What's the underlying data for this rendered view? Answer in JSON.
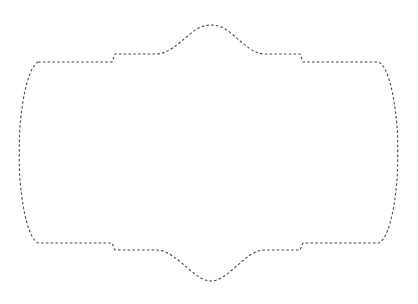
{
  "canvas": {
    "width": 418,
    "height": 304,
    "background_color": "#ffffff",
    "description": "dashed-ornamental-frame-outline"
  },
  "shape": {
    "name": "ornamental-label-frame",
    "stroke_color": "#4a4a52",
    "stroke_width": 1.1,
    "fill": "none",
    "dash_pattern": "2.6 2.2",
    "dash_offset": 0,
    "line_cap": "butt",
    "line_join": "round",
    "bounds": {
      "left": 19,
      "right": 398,
      "top": 25,
      "bottom": 281
    },
    "geometry": {
      "top_corner_y": 62,
      "bottom_corner_y": 243,
      "top_shoulder_y": 54,
      "bottom_shoulder_y": 250,
      "left_step_x": 115,
      "right_step_x": 300,
      "left_corner_x": 38,
      "right_corner_x": 380,
      "top_dome_apex_y": 25,
      "bottom_dome_apex_y": 281,
      "dome_start_x": 155,
      "dome_end_x": 265,
      "left_bulge_x": 19,
      "right_bulge_x": 398,
      "vertical_mid_y": 152
    },
    "path_d": "M 38 62 L 112 62 L 115 54 L 156 54 C 168 54 178 44 190 34 C 198 27 205 25 211 25 C 217 25 224 27 232 34 C 244 44 253 54 265 54 L 300 54 L 303 62 L 379 62 C 388 68 394 92 397 126 C 398 140 398 166 397 180 C 394 214 388 238 379 243 L 303 243 L 300 250 L 265 250 C 253 250 244 260 232 270 C 224 277 217 281 211 281 C 205 281 198 277 190 270 C 178 260 168 250 156 250 L 115 250 L 112 243 L 38 243 C 29 238 23 214 20 180 C 19 166 19 140 20 126 C 23 92 29 68 38 62 Z"
  }
}
